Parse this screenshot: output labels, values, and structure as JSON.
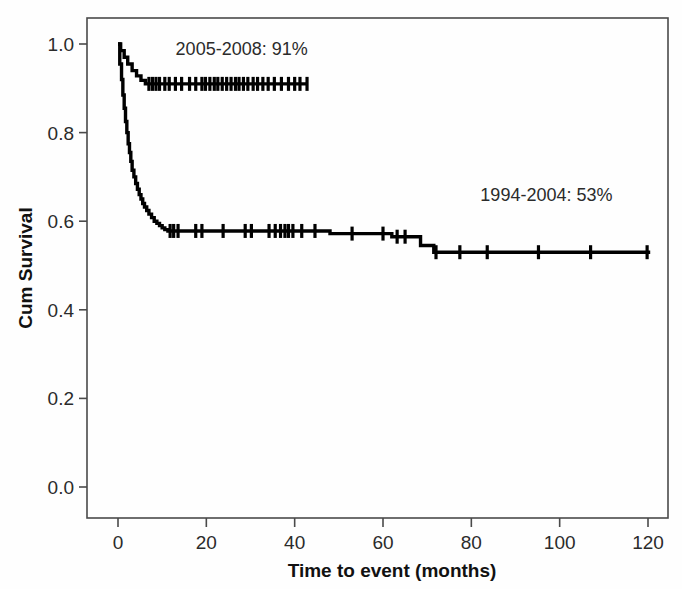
{
  "chart_data": {
    "type": "line",
    "title": "",
    "xlabel": "Time to event (months)",
    "ylabel": "Cum Survival",
    "xlim": [
      0,
      125
    ],
    "ylim": [
      0.0,
      1.05
    ],
    "grid": false,
    "legend_position": "inline-annotation",
    "xticks": [
      0,
      20,
      40,
      60,
      80,
      100,
      120
    ],
    "xtick_labels": [
      "0",
      "20",
      "40",
      "60",
      "80",
      "100",
      "120"
    ],
    "yticks": [
      0.0,
      0.2,
      0.4,
      0.6,
      0.8,
      1.0
    ],
    "ytick_labels": [
      "0.0",
      "0.2",
      "0.4",
      "0.6",
      "0.8",
      "1.0"
    ],
    "annotations": [
      {
        "text": "2005-2008: 91%",
        "x": 28,
        "y": 0.975,
        "series": "2005-2008"
      },
      {
        "text": "1994-2004: 53%",
        "x": 97,
        "y": 0.645,
        "series": "1994-2004"
      }
    ],
    "series": [
      {
        "name": "2005-2008",
        "final_survival": 0.91,
        "final_survival_label": "91%",
        "color": "#000000",
        "x": [
          0,
          0.6,
          0.6,
          1.4,
          1.4,
          2.2,
          2.2,
          3.2,
          3.2,
          4.2,
          4.2,
          5.2,
          5.2,
          6.2,
          6.2,
          43.0
        ],
        "y": [
          1.0,
          1.0,
          0.985,
          0.985,
          0.97,
          0.97,
          0.955,
          0.955,
          0.94,
          0.94,
          0.928,
          0.928,
          0.918,
          0.918,
          0.91,
          0.91
        ],
        "censor_x": [
          7.0,
          7.8,
          8.6,
          9.4,
          10.6,
          11.6,
          13.0,
          14.4,
          16.2,
          17.6,
          19.0,
          19.8,
          20.8,
          21.8,
          22.6,
          23.6,
          24.6,
          25.6,
          26.6,
          27.4,
          28.4,
          29.4,
          30.6,
          31.6,
          32.8,
          34.0,
          35.4,
          37.0,
          38.6,
          40.0,
          41.2,
          42.8
        ],
        "censor_y": 0.91
      },
      {
        "name": "1994-2004",
        "final_survival": 0.53,
        "final_survival_label": "53%",
        "color": "#000000",
        "x": [
          0,
          0.4,
          0.4,
          0.8,
          0.8,
          1.1,
          1.1,
          1.4,
          1.4,
          1.7,
          1.7,
          2.0,
          2.0,
          2.3,
          2.3,
          2.6,
          2.6,
          2.9,
          2.9,
          3.2,
          3.2,
          3.6,
          3.6,
          4.0,
          4.0,
          4.4,
          4.4,
          4.8,
          4.8,
          5.2,
          5.2,
          5.6,
          5.6,
          6.0,
          6.0,
          6.5,
          6.5,
          7.0,
          7.0,
          7.6,
          7.6,
          8.2,
          8.2,
          8.8,
          8.8,
          9.4,
          9.4,
          10.0,
          10.0,
          10.6,
          10.6,
          11.3,
          11.3,
          48.0,
          48.0,
          62.0,
          62.0,
          68.5,
          68.5,
          71.5,
          71.5,
          120.5
        ],
        "y": [
          1.0,
          1.0,
          0.955,
          0.955,
          0.92,
          0.92,
          0.885,
          0.885,
          0.855,
          0.855,
          0.825,
          0.825,
          0.8,
          0.8,
          0.775,
          0.775,
          0.755,
          0.755,
          0.735,
          0.735,
          0.715,
          0.715,
          0.7,
          0.7,
          0.685,
          0.685,
          0.672,
          0.672,
          0.66,
          0.66,
          0.65,
          0.65,
          0.64,
          0.64,
          0.632,
          0.632,
          0.624,
          0.624,
          0.616,
          0.616,
          0.608,
          0.608,
          0.6,
          0.6,
          0.595,
          0.595,
          0.59,
          0.59,
          0.585,
          0.585,
          0.581,
          0.581,
          0.578,
          0.578,
          0.572,
          0.572,
          0.565,
          0.565,
          0.545,
          0.545,
          0.53,
          0.53
        ],
        "censor_x": [
          11.8,
          12.6,
          13.6,
          17.6,
          19.0,
          23.8,
          28.8,
          30.2,
          34.2,
          35.6,
          36.8,
          37.8,
          38.6,
          39.6,
          41.6,
          44.6,
          53.0,
          60.0,
          63.2,
          65.0,
          72.0,
          77.4,
          83.6,
          95.2,
          107.0,
          119.8
        ],
        "censor_y_map": [
          0.578,
          0.578,
          0.578,
          0.578,
          0.578,
          0.578,
          0.578,
          0.578,
          0.578,
          0.578,
          0.578,
          0.578,
          0.578,
          0.578,
          0.578,
          0.578,
          0.572,
          0.572,
          0.565,
          0.565,
          0.53,
          0.53,
          0.53,
          0.53,
          0.53,
          0.53
        ]
      }
    ]
  },
  "figure": {
    "background_color": "#ffffff",
    "axis_color": "#4a4a4a",
    "curve_color": "#000000"
  }
}
